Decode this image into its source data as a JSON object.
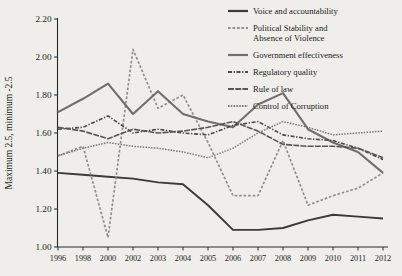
{
  "chart_data": {
    "type": "line",
    "title": "",
    "xlabel": "",
    "ylabel": "Maximum 2.5, minimum -2.5",
    "categories": [
      "1996",
      "1998",
      "2000",
      "2002",
      "2003",
      "2004",
      "2005",
      "2006",
      "2007",
      "2008",
      "2009",
      "2010",
      "2011",
      "2012"
    ],
    "ylim": [
      1.0,
      2.2
    ],
    "ytick_labels": [
      "2.20",
      "2.00",
      "1.80",
      "1.60",
      "1.40",
      "1.20",
      "1.00"
    ],
    "yticks": [
      2.2,
      2.0,
      1.8,
      1.6,
      1.4,
      1.2,
      1.0
    ],
    "grid": false,
    "legend_position": "top-right",
    "series": [
      {
        "name": "Voice and accountability",
        "style": "solid",
        "color": "#3a3a3a",
        "width": 1.9,
        "values": [
          1.39,
          1.38,
          1.37,
          1.36,
          1.34,
          1.33,
          1.22,
          1.09,
          1.09,
          1.1,
          1.14,
          1.17,
          1.16,
          1.15
        ]
      },
      {
        "name": "Political Stability and Absence of Violence",
        "style": "dotted",
        "color": "#8e8e8e",
        "width": 1.7,
        "values": [
          1.48,
          1.53,
          1.05,
          2.04,
          1.73,
          1.8,
          1.55,
          1.27,
          1.27,
          1.56,
          1.22,
          1.27,
          1.31,
          1.39
        ]
      },
      {
        "name": "Government effectiveness",
        "style": "solid",
        "color": "#6f6f6f",
        "width": 2.1,
        "values": [
          1.71,
          1.78,
          1.86,
          1.7,
          1.82,
          1.7,
          1.66,
          1.63,
          1.75,
          1.81,
          1.62,
          1.55,
          1.5,
          1.39
        ]
      },
      {
        "name": "Regulatory quality",
        "style": "dash-dot",
        "color": "#4a4a4a",
        "width": 1.6,
        "values": [
          1.62,
          1.63,
          1.69,
          1.6,
          1.62,
          1.6,
          1.59,
          1.64,
          1.66,
          1.59,
          1.57,
          1.56,
          1.52,
          1.46
        ]
      },
      {
        "name": "Rule of law",
        "style": "solid-thin",
        "color": "#565656",
        "width": 1.6,
        "values": [
          1.63,
          1.61,
          1.57,
          1.62,
          1.6,
          1.61,
          1.63,
          1.66,
          1.61,
          1.54,
          1.53,
          1.53,
          1.52,
          1.47
        ]
      },
      {
        "name": "Control of Corruption",
        "style": "fine-dotted",
        "color": "#767676",
        "width": 1.5,
        "values": [
          1.48,
          1.52,
          1.55,
          1.53,
          1.52,
          1.5,
          1.47,
          1.52,
          1.6,
          1.66,
          1.63,
          1.59,
          1.6,
          1.61
        ]
      }
    ]
  },
  "legend": {
    "items": [
      {
        "label": "Voice and accountability"
      },
      {
        "label": "Political Stability and"
      },
      {
        "label": "Absence of Violence"
      },
      {
        "label": "Government effectiveness"
      },
      {
        "label": "Regulatory quality"
      },
      {
        "label": "Rule of law"
      },
      {
        "label": "Control of Corruption"
      }
    ]
  }
}
